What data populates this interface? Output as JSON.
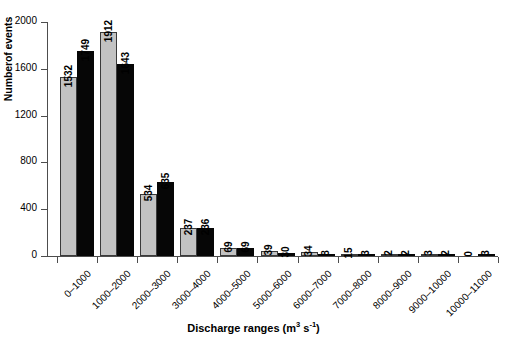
{
  "chart_data": {
    "type": "bar",
    "title": "",
    "xlabel": "Discharge ranges (m3 s-1)",
    "xlabel_parts": {
      "text_before": "Discharge ranges (m",
      "sup1": "3",
      "mid": " s",
      "sup2": "-1",
      "text_after": ")"
    },
    "ylabel": "Numberof events",
    "ylim": [
      0,
      2000
    ],
    "yticks": [
      0,
      400,
      800,
      1200,
      1600,
      2000
    ],
    "grid": false,
    "legend": "none",
    "categories": [
      "0–1000",
      "1000–2000",
      "2000–3000",
      "3000–4000",
      "4000–5000",
      "5000–6000",
      "6000–7000",
      "7000–8000",
      "8000–9000",
      "9000–10000",
      "10000–11000"
    ],
    "series": [
      {
        "name": "series-grey",
        "color": "#c2c2c2",
        "values": [
          1532,
          1912,
          534,
          237,
          69,
          39,
          34,
          15,
          2,
          3,
          0
        ]
      },
      {
        "name": "series-black",
        "color": "#060606",
        "values": [
          1749,
          1643,
          635,
          236,
          69,
          30,
          8,
          3,
          2,
          2,
          3
        ]
      }
    ]
  }
}
